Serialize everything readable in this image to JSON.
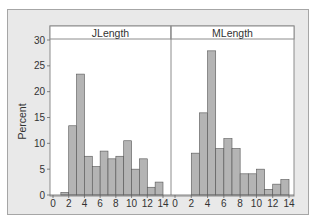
{
  "chart_data": {
    "type": "bar",
    "subtype": "histogram-panel",
    "ylabel": "Percent",
    "ylim": [
      0,
      30
    ],
    "yticks": [
      0,
      5,
      10,
      15,
      20,
      25,
      30
    ],
    "xticks": [
      0,
      2,
      4,
      6,
      8,
      10,
      12,
      14
    ],
    "xlim": [
      0,
      14
    ],
    "bin_width": 1,
    "grid": false,
    "legend": null,
    "colors": {
      "bar_fill": "#b4b4b4",
      "bar_edge": "#555555",
      "frame_bg": "#e9e9e9",
      "plot_bg": "#ffffff"
    },
    "panels": [
      {
        "title": "JLength",
        "bins": [
          [
            0,
            1
          ],
          [
            1,
            2
          ],
          [
            2,
            3
          ],
          [
            3,
            4
          ],
          [
            4,
            5
          ],
          [
            5,
            6
          ],
          [
            6,
            7
          ],
          [
            7,
            8
          ],
          [
            8,
            9
          ],
          [
            9,
            10
          ],
          [
            10,
            11
          ],
          [
            11,
            12
          ],
          [
            12,
            13
          ],
          [
            13,
            14
          ]
        ],
        "values": [
          0,
          0.5,
          13.4,
          23.4,
          7.5,
          5.5,
          8.5,
          7.0,
          7.5,
          10.5,
          5.0,
          7.0,
          1.5,
          2.5
        ]
      },
      {
        "title": "MLength",
        "bins": [
          [
            0,
            1
          ],
          [
            1,
            2
          ],
          [
            2,
            3
          ],
          [
            3,
            4
          ],
          [
            4,
            5
          ],
          [
            5,
            6
          ],
          [
            6,
            7
          ],
          [
            7,
            8
          ],
          [
            8,
            9
          ],
          [
            9,
            10
          ],
          [
            10,
            11
          ],
          [
            11,
            12
          ],
          [
            12,
            13
          ],
          [
            13,
            14
          ]
        ],
        "values": [
          0,
          0,
          8.1,
          15.9,
          27.9,
          9.0,
          10.9,
          9.0,
          4.1,
          4.1,
          5.0,
          1.1,
          2.1,
          3.0
        ]
      }
    ]
  }
}
